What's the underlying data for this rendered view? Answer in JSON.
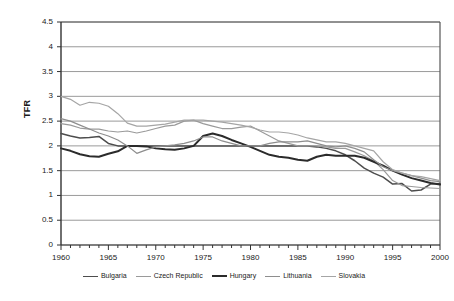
{
  "chart_data": {
    "type": "line",
    "title": "",
    "xlabel": "",
    "ylabel": "TFR",
    "xlim": [
      1960,
      2000
    ],
    "ylim": [
      0,
      4.5
    ],
    "ytick_step": 0.5,
    "xtick_step": 5,
    "x_minor_tick_step": 1,
    "grid": "horizontal",
    "legend_position": "bottom",
    "ytick_labels": [
      "0",
      "0.5",
      "1",
      "1.5",
      "2",
      "2.5",
      "3",
      "3.5",
      "4",
      "4.5"
    ],
    "xtick_labels": [
      "1960",
      "1965",
      "1970",
      "1975",
      "1980",
      "1985",
      "1990",
      "1995",
      "2000"
    ],
    "x": [
      1960,
      1961,
      1962,
      1963,
      1964,
      1965,
      1966,
      1967,
      1968,
      1969,
      1970,
      1971,
      1972,
      1973,
      1974,
      1975,
      1976,
      1977,
      1978,
      1979,
      1980,
      1981,
      1982,
      1983,
      1984,
      1985,
      1986,
      1987,
      1988,
      1989,
      1990,
      1991,
      1992,
      1993,
      1994,
      1995,
      1996,
      1997,
      1998,
      1999,
      2000
    ],
    "series": [
      {
        "name": "Bulgaria",
        "color": "#4d4d4d",
        "width": 1.5,
        "values": [
          2.25,
          2.2,
          2.16,
          2.17,
          2.19,
          2.05,
          2.0,
          2.0,
          2.0,
          2.0,
          2.0,
          2.0,
          2.0,
          2.0,
          2.0,
          2.0,
          2.0,
          2.0,
          2.0,
          2.0,
          2.0,
          2.0,
          2.0,
          2.0,
          2.0,
          2.0,
          2.0,
          1.98,
          1.95,
          1.9,
          1.82,
          1.7,
          1.55,
          1.45,
          1.37,
          1.23,
          1.24,
          1.09,
          1.11,
          1.23,
          1.24
        ]
      },
      {
        "name": "Czech Republic",
        "color": "#9a9a9a",
        "width": 1.2,
        "values": [
          2.45,
          2.42,
          2.36,
          2.34,
          2.34,
          2.3,
          2.28,
          2.3,
          2.26,
          2.3,
          2.35,
          2.4,
          2.42,
          2.5,
          2.52,
          2.45,
          2.4,
          2.35,
          2.35,
          2.38,
          2.4,
          2.3,
          2.2,
          2.1,
          2.05,
          2.0,
          2.0,
          2.0,
          1.98,
          1.95,
          1.95,
          1.88,
          1.8,
          1.7,
          1.52,
          1.3,
          1.2,
          1.18,
          1.16,
          1.15,
          1.14
        ]
      },
      {
        "name": "Hungary",
        "color": "#2b2b2b",
        "width": 2.0,
        "values": [
          1.95,
          1.9,
          1.83,
          1.79,
          1.78,
          1.84,
          1.89,
          2.0,
          2.0,
          1.99,
          1.95,
          1.93,
          1.92,
          1.95,
          2.0,
          2.2,
          2.25,
          2.2,
          2.12,
          2.05,
          1.98,
          1.9,
          1.82,
          1.78,
          1.76,
          1.72,
          1.7,
          1.78,
          1.82,
          1.8,
          1.8,
          1.8,
          1.76,
          1.68,
          1.6,
          1.5,
          1.42,
          1.35,
          1.3,
          1.25,
          1.22
        ]
      },
      {
        "name": "Lithuania",
        "color": "#8e8e8e",
        "width": 1.2,
        "values": [
          2.55,
          2.5,
          2.42,
          2.34,
          2.26,
          2.2,
          2.12,
          2.0,
          1.85,
          1.92,
          1.98,
          2.0,
          2.02,
          2.05,
          2.1,
          2.18,
          2.18,
          2.1,
          2.05,
          2.0,
          2.0,
          2.0,
          2.05,
          2.08,
          2.08,
          2.08,
          2.1,
          2.05,
          2.0,
          1.98,
          2.0,
          1.95,
          1.88,
          1.72,
          1.58,
          1.5,
          1.45,
          1.4,
          1.35,
          1.3,
          1.28
        ]
      },
      {
        "name": "Slovakia",
        "color": "#a5a5a5",
        "width": 1.2,
        "values": [
          3.0,
          2.94,
          2.82,
          2.88,
          2.86,
          2.8,
          2.65,
          2.46,
          2.4,
          2.4,
          2.42,
          2.44,
          2.48,
          2.52,
          2.52,
          2.52,
          2.5,
          2.48,
          2.45,
          2.42,
          2.38,
          2.32,
          2.28,
          2.28,
          2.26,
          2.22,
          2.16,
          2.12,
          2.08,
          2.08,
          2.05,
          2.0,
          1.95,
          1.9,
          1.68,
          1.52,
          1.45,
          1.4,
          1.38,
          1.34,
          1.3
        ]
      }
    ]
  },
  "axis": {
    "ylabel_text": "TFR"
  },
  "legend": {
    "items": [
      {
        "label": "Bulgaria"
      },
      {
        "label": "Czech Republic"
      },
      {
        "label": "Hungary"
      },
      {
        "label": "Lithuania"
      },
      {
        "label": "Slovakia"
      }
    ]
  }
}
